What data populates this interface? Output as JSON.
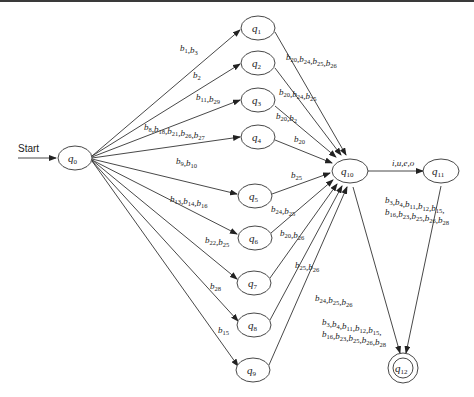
{
  "diagram": {
    "type": "finite-state-automaton",
    "start_label": "Start",
    "start_state": "q0",
    "accept_states": [
      "q12"
    ],
    "states": [
      {
        "id": "q0",
        "label": "q",
        "sub": "0"
      },
      {
        "id": "q1",
        "label": "q",
        "sub": "1"
      },
      {
        "id": "q2",
        "label": "q",
        "sub": "2"
      },
      {
        "id": "q3",
        "label": "q",
        "sub": "3"
      },
      {
        "id": "q4",
        "label": "q",
        "sub": "4"
      },
      {
        "id": "q5",
        "label": "q",
        "sub": "5"
      },
      {
        "id": "q6",
        "label": "q",
        "sub": "6"
      },
      {
        "id": "q7",
        "label": "q",
        "sub": "7"
      },
      {
        "id": "q8",
        "label": "q",
        "sub": "8"
      },
      {
        "id": "q9",
        "label": "q",
        "sub": "9"
      },
      {
        "id": "q10",
        "label": "q",
        "sub": "10"
      },
      {
        "id": "q11",
        "label": "q",
        "sub": "11"
      },
      {
        "id": "q12",
        "label": "q",
        "sub": "12"
      }
    ],
    "transitions": [
      {
        "from": "q0",
        "to": "q1",
        "label": "b1,b3"
      },
      {
        "from": "q0",
        "to": "q2",
        "label": "b2"
      },
      {
        "from": "q0",
        "to": "q3",
        "label": "b11,b29"
      },
      {
        "from": "q0",
        "to": "q4",
        "label": "b8,b18,b21,b26,b27"
      },
      {
        "from": "q0",
        "to": "q5",
        "label": "b9,b10"
      },
      {
        "from": "q0",
        "to": "q6",
        "label": "b13,b14,b16"
      },
      {
        "from": "q0",
        "to": "q7",
        "label": "b22,b25"
      },
      {
        "from": "q0",
        "to": "q8",
        "label": "b28"
      },
      {
        "from": "q0",
        "to": "q9",
        "label": "b15"
      },
      {
        "from": "q1",
        "to": "q10",
        "label": "b20,b24,b25,b26"
      },
      {
        "from": "q2",
        "to": "q10",
        "label": "b20,b24,b25"
      },
      {
        "from": "q3",
        "to": "q10",
        "label": "b20,b2"
      },
      {
        "from": "q4",
        "to": "q10",
        "label": "b20"
      },
      {
        "from": "q5",
        "to": "q10",
        "label": "b25"
      },
      {
        "from": "q6",
        "to": "q10",
        "label": "b24,b25"
      },
      {
        "from": "q7",
        "to": "q10",
        "label": "b20,b26"
      },
      {
        "from": "q8",
        "to": "q10",
        "label": "b25,b26"
      },
      {
        "from": "q9",
        "to": "q10",
        "label": "b24,b25,b26"
      },
      {
        "from": "q10",
        "to": "q11",
        "label": "i,u,e,o"
      },
      {
        "from": "q11",
        "to": "q12",
        "label": "b3,b4,b11,b12,b15, b16,b23,b25,b26,b28"
      },
      {
        "from": "q10",
        "to": "q12",
        "label": "b3,b4,b11,b12,b15, b16,b23,b25,b26,b28"
      }
    ]
  },
  "labels": {
    "start": "Start",
    "q0": [
      "q",
      "0"
    ],
    "q1": [
      "q",
      "1"
    ],
    "q2": [
      "q",
      "2"
    ],
    "q3": [
      "q",
      "3"
    ],
    "q4": [
      "q",
      "4"
    ],
    "q5": [
      "q",
      "5"
    ],
    "q6": [
      "q",
      "6"
    ],
    "q7": [
      "q",
      "7"
    ],
    "q8": [
      "q",
      "8"
    ],
    "q9": [
      "q",
      "9"
    ],
    "q10": [
      "q",
      "10"
    ],
    "q11": [
      "q",
      "11"
    ],
    "q12": [
      "q",
      "12"
    ],
    "e01": [
      [
        "b",
        "1"
      ],
      ",",
      [
        "b",
        "3"
      ]
    ],
    "e02": [
      [
        "b",
        "2"
      ]
    ],
    "e03": [
      [
        "b",
        "11"
      ],
      ",",
      [
        "b",
        "29"
      ]
    ],
    "e04": [
      [
        "b",
        "8"
      ],
      ",",
      [
        "b",
        "18"
      ],
      ",",
      [
        "b",
        "21"
      ],
      ",",
      [
        "b",
        "26"
      ],
      ",",
      [
        "b",
        "27"
      ]
    ],
    "e05": [
      [
        "b",
        "9"
      ],
      ",",
      [
        "b",
        "10"
      ]
    ],
    "e06": [
      [
        "b",
        "13"
      ],
      ",",
      [
        "b",
        "14"
      ],
      ",",
      [
        "b",
        "16"
      ]
    ],
    "e07": [
      [
        "b",
        "22"
      ],
      ",",
      [
        "b",
        "25"
      ]
    ],
    "e08": [
      [
        "b",
        "28"
      ]
    ],
    "e09": [
      [
        "b",
        "15"
      ]
    ],
    "e1_10": [
      [
        "b",
        "20"
      ],
      ",",
      [
        "b",
        "24"
      ],
      ",",
      [
        "b",
        "25"
      ],
      ",",
      [
        "b",
        "26"
      ]
    ],
    "e2_10": [
      [
        "b",
        "20"
      ],
      ",",
      [
        "b",
        "24"
      ],
      ",",
      [
        "b",
        "25"
      ]
    ],
    "e3_10": [
      [
        "b",
        "20"
      ],
      ",",
      [
        "b",
        "2"
      ]
    ],
    "e4_10": [
      [
        "b",
        "20"
      ]
    ],
    "e5_10": [
      [
        "b",
        "25"
      ]
    ],
    "e6_10": [
      [
        "b",
        "24"
      ],
      ",",
      [
        "b",
        "25"
      ]
    ],
    "e7_10": [
      [
        "b",
        "20"
      ],
      ",",
      [
        "b",
        "26"
      ]
    ],
    "e8_10": [
      [
        "b",
        "25"
      ],
      ",",
      [
        "b",
        "26"
      ]
    ],
    "e9_10": [
      [
        "b",
        "24"
      ],
      ",",
      [
        "b",
        "25"
      ],
      ",",
      [
        "b",
        "26"
      ]
    ],
    "e10_11": "i,u,e,o",
    "e11_12_l1": [
      [
        "b",
        "3"
      ],
      ",",
      [
        "b",
        "4"
      ],
      ",",
      [
        "b",
        "11"
      ],
      ",",
      [
        "b",
        "12"
      ],
      ",",
      [
        "b",
        "15"
      ],
      ","
    ],
    "e11_12_l2": [
      [
        "b",
        "16"
      ],
      ",",
      [
        "b",
        "23"
      ],
      ",",
      [
        "b",
        "25"
      ],
      ",",
      [
        "b",
        "26"
      ],
      ",",
      [
        "b",
        "28"
      ]
    ],
    "e10_12_l1": [
      [
        "b",
        "3"
      ],
      ",",
      [
        "b",
        "4"
      ],
      ",",
      [
        "b",
        "11"
      ],
      ",",
      [
        "b",
        "12"
      ],
      ",",
      [
        "b",
        "15"
      ],
      ","
    ],
    "e10_12_l2": [
      [
        "b",
        "16"
      ],
      ",",
      [
        "b",
        "23"
      ],
      ",",
      [
        "b",
        "25"
      ],
      ",",
      [
        "b",
        "26"
      ],
      ",",
      [
        "b",
        "28"
      ]
    ]
  }
}
